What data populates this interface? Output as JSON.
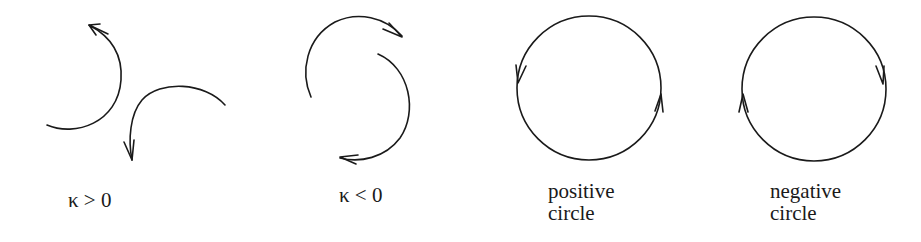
{
  "figures": [
    {
      "id": "kappa-positive",
      "label": "κ > 0",
      "description": "two arcs curving counterclockwise (arrows)"
    },
    {
      "id": "kappa-negative",
      "label": "κ < 0",
      "description": "two arcs curving clockwise (arrows)"
    },
    {
      "id": "positive-circle",
      "label_line1": "positive",
      "label_line2": "circle",
      "orientation": "counterclockwise"
    },
    {
      "id": "negative-circle",
      "label_line1": "negative",
      "label_line2": "circle",
      "orientation": "clockwise"
    }
  ],
  "colors": {
    "stroke": "#1a1a1a",
    "background": "#ffffff"
  }
}
